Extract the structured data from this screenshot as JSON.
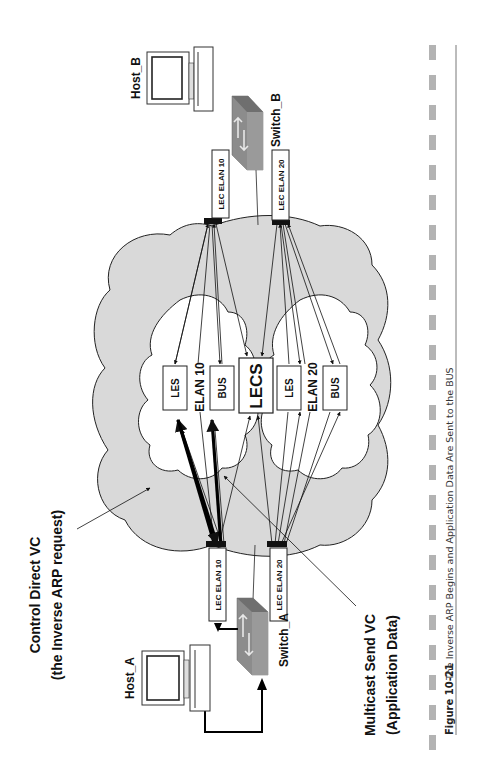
{
  "figure": {
    "number": "Figure 10-21",
    "caption": "The Inverse ARP Begins and Application Data Are Sent to the BUS"
  },
  "callouts": {
    "control_direct_line1": "Control Direct VC",
    "control_direct_line2": "(the Inverse ARP request)",
    "multicast_send_line1": "Multicast Send VC",
    "multicast_send_line2": "(Application Data)"
  },
  "hosts": {
    "host_a": "Host_A",
    "host_b": "Host_B"
  },
  "switches": {
    "switch_a": "Switch_A",
    "switch_b": "Switch_B"
  },
  "lecs_boxes": {
    "switch_b_elan10": "LEC ELAN 10",
    "switch_b_elan20": "LEC ELAN 20",
    "switch_a_elan10": "LEC ELAN 10",
    "switch_a_elan20": "LEC ELAN 20"
  },
  "elan10": {
    "label": "ELAN 10",
    "les": "LES",
    "bus": "BUS"
  },
  "elan20": {
    "label": "ELAN 20",
    "les": "LES",
    "bus": "BUS"
  },
  "lecs": "LECS",
  "colors": {
    "cloud_fill": "#d9d9d9",
    "inner_cloud_fill": "#ffffff",
    "switch_fill": "#8c8c8c",
    "caption_bar": "#b3b3b3",
    "line": "#111111"
  }
}
